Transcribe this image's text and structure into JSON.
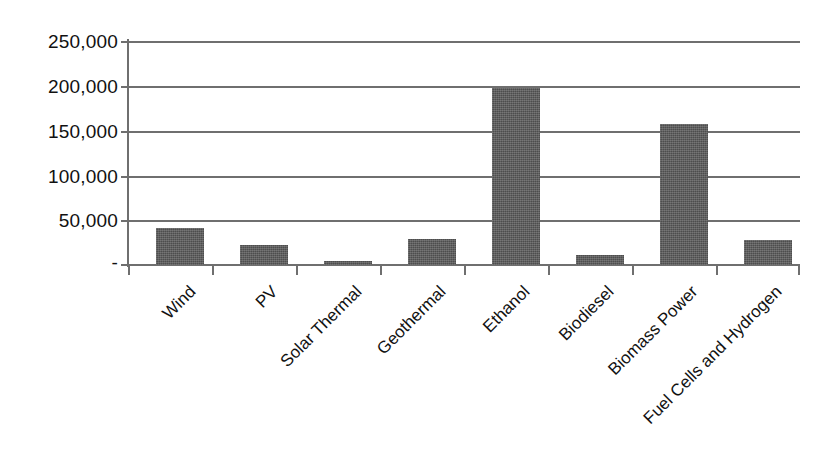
{
  "chart_data": {
    "type": "bar",
    "title": "",
    "subtitle": "",
    "xlabel": "",
    "ylabel": "",
    "categories": [
      "Wind",
      "PV",
      "Solar Thermal",
      "Geothermal",
      "Ethanol",
      "Biodiesel",
      "Biomass Power",
      "Fuel Cells and Hydrogen"
    ],
    "values": [
      41000,
      22000,
      4000,
      29000,
      198000,
      11000,
      157000,
      28000
    ],
    "series": [
      {
        "name": "",
        "values": [
          41000,
          22000,
          4000,
          29000,
          198000,
          11000,
          157000,
          28000
        ]
      }
    ],
    "ylim": [
      0,
      250000
    ],
    "ytick_values": [
      0,
      50000,
      100000,
      150000,
      200000,
      250000
    ],
    "ytick_labels": [
      "-",
      "50,000",
      "100,000",
      "150,000",
      "200,000",
      "250,000"
    ],
    "grid": true,
    "grid_axis": "y",
    "legend": false,
    "legend_position": "none",
    "bar_color": "#4d4d4d",
    "gridline_color": "#6f6f6f",
    "background_color": "#ffffff",
    "xtick_label_rotation": -45,
    "annotations": []
  },
  "axes": {
    "y_axis_name": "value-axis",
    "x_axis_name": "category-axis"
  }
}
